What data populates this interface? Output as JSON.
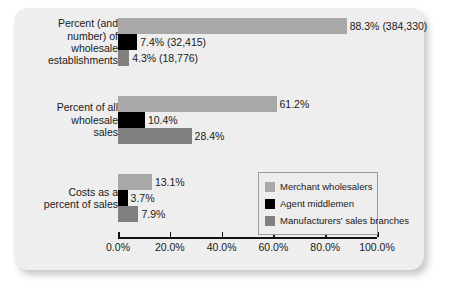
{
  "chart_data": {
    "type": "bar",
    "orientation": "horizontal",
    "title": "",
    "xlabel": "",
    "ylabel": "",
    "xlim": [
      0,
      100
    ],
    "xticks": [
      0,
      20,
      40,
      60,
      80,
      100
    ],
    "xtick_labels": [
      "0.0%",
      "20.0%",
      "40.0%",
      "60.0%",
      "80.0%",
      "100.0%"
    ],
    "grid": false,
    "legend_position": "lower-right",
    "categories": [
      "Percent (and number) of wholesale establishments",
      "Percent of all wholesale sales",
      "Costs as a percent of sales"
    ],
    "category_lines": [
      [
        "Percent (and",
        "number) of",
        "wholesale",
        "establishments"
      ],
      [
        "Percent of all",
        "wholesale",
        "sales"
      ],
      [
        "Costs as a",
        "percent of sales"
      ]
    ],
    "series": [
      {
        "name": "Merchant wholesalers",
        "color": "#a8a8a8",
        "values": [
          88.3,
          61.2,
          13.1
        ],
        "labels": [
          "88.3% (384,330)",
          "61.2%",
          "13.1%"
        ]
      },
      {
        "name": "Agent middlemen",
        "color": "#000000",
        "values": [
          7.4,
          10.4,
          3.7
        ],
        "labels": [
          "7.4% (32,415)",
          "10.4%",
          "3.7%"
        ]
      },
      {
        "name": "Manufacturers' sales branches",
        "color": "#808080",
        "values": [
          4.3,
          28.4,
          7.9
        ],
        "labels": [
          "4.3% (18,776)",
          "28.4%",
          "7.9%"
        ]
      }
    ]
  },
  "legend": {
    "items": [
      {
        "label": "Merchant wholesalers"
      },
      {
        "label": "Agent middlemen"
      },
      {
        "label": "Manufacturers' sales branches"
      }
    ]
  }
}
